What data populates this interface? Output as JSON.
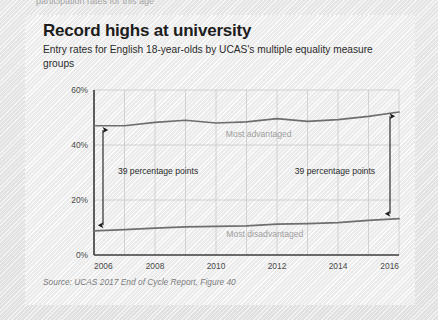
{
  "page": {
    "clipped_top_text": "participation rates for this age"
  },
  "card": {
    "title": "Record highs at university",
    "subtitle": "Entry rates for English 18-year-olds by UCAS's multiple equality measure groups",
    "source": "Source: UCAS 2017 End of Cycle Report, Figure 40"
  },
  "chart_data": {
    "type": "line",
    "title": "Record highs at university",
    "subtitle": "Entry rates for English 18-year-olds by UCAS's multiple equality measure groups",
    "xlabel": "",
    "ylabel": "",
    "x": [
      2006,
      2007,
      2008,
      2009,
      2010,
      2011,
      2012,
      2013,
      2014,
      2015,
      2016
    ],
    "xlim": [
      2006,
      2016
    ],
    "ylim": [
      0,
      60
    ],
    "yticks": [
      0,
      20,
      40,
      60
    ],
    "ytick_labels": [
      "0%",
      "20%",
      "40%",
      "60%"
    ],
    "xticks": [
      2006,
      2008,
      2010,
      2012,
      2014,
      2016
    ],
    "xtick_labels": [
      "2006",
      "2008",
      "2010",
      "2012",
      "2014",
      "2016"
    ],
    "grid": true,
    "legend_position": "inline",
    "series": [
      {
        "name": "Most advantaged",
        "color": "#6e6e6e",
        "values": [
          47.0,
          47.0,
          48.2,
          49.0,
          48.0,
          48.4,
          49.6,
          48.6,
          49.2,
          50.4,
          52.0
        ]
      },
      {
        "name": "Most disadvantaged",
        "color": "#6e6e6e",
        "values": [
          8.8,
          9.2,
          9.8,
          10.2,
          10.4,
          10.6,
          11.2,
          11.4,
          11.8,
          12.6,
          13.2
        ]
      }
    ],
    "annotations": [
      {
        "id": "gap-left",
        "text": "39 percentage points",
        "x": 2006,
        "y_top": 45.5,
        "y_bottom": 10.8
      },
      {
        "id": "gap-right",
        "text": "39 percentage points",
        "x": 2016,
        "y_top": 50.5,
        "y_bottom": 15.0
      }
    ],
    "series_inline_labels": [
      {
        "name": "Most advantaged",
        "x": 2011.4,
        "y": 43.0
      },
      {
        "name": "Most disadvantaged",
        "x": 2011.6,
        "y": 6.6
      }
    ]
  }
}
